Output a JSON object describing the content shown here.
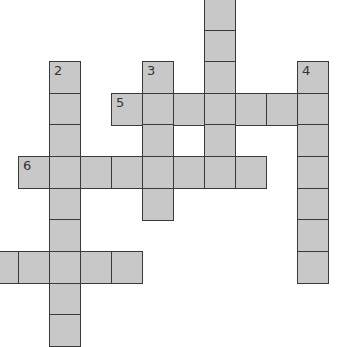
{
  "puzzle": {
    "cell_size": 31,
    "cell_fill": "#c8c8c8",
    "border_color": "#3a3a3a",
    "cells": [
      {
        "x": 204,
        "y": -1
      },
      {
        "x": 204,
        "y": 30
      },
      {
        "x": 49,
        "y": 61,
        "num": "2"
      },
      {
        "x": 142,
        "y": 61,
        "num": "3"
      },
      {
        "x": 204,
        "y": 61
      },
      {
        "x": 297,
        "y": 61,
        "num": "4"
      },
      {
        "x": 49,
        "y": 93
      },
      {
        "x": 111,
        "y": 93,
        "num": "5"
      },
      {
        "x": 142,
        "y": 93
      },
      {
        "x": 173,
        "y": 93
      },
      {
        "x": 204,
        "y": 93
      },
      {
        "x": 235,
        "y": 93
      },
      {
        "x": 266,
        "y": 93
      },
      {
        "x": 297,
        "y": 93
      },
      {
        "x": 49,
        "y": 124
      },
      {
        "x": 142,
        "y": 124
      },
      {
        "x": 204,
        "y": 124
      },
      {
        "x": 297,
        "y": 124
      },
      {
        "x": 18,
        "y": 156,
        "num": "6"
      },
      {
        "x": 49,
        "y": 156
      },
      {
        "x": 80,
        "y": 156
      },
      {
        "x": 111,
        "y": 156
      },
      {
        "x": 142,
        "y": 156
      },
      {
        "x": 173,
        "y": 156
      },
      {
        "x": 204,
        "y": 156
      },
      {
        "x": 235,
        "y": 156
      },
      {
        "x": 297,
        "y": 156
      },
      {
        "x": 49,
        "y": 188
      },
      {
        "x": 142,
        "y": 188
      },
      {
        "x": 297,
        "y": 188
      },
      {
        "x": 49,
        "y": 219
      },
      {
        "x": 297,
        "y": 219
      },
      {
        "x": -13,
        "y": 251
      },
      {
        "x": 18,
        "y": 251
      },
      {
        "x": 49,
        "y": 251
      },
      {
        "x": 80,
        "y": 251
      },
      {
        "x": 111,
        "y": 251
      },
      {
        "x": 297,
        "y": 251
      },
      {
        "x": 49,
        "y": 283
      },
      {
        "x": 49,
        "y": 314
      }
    ]
  }
}
